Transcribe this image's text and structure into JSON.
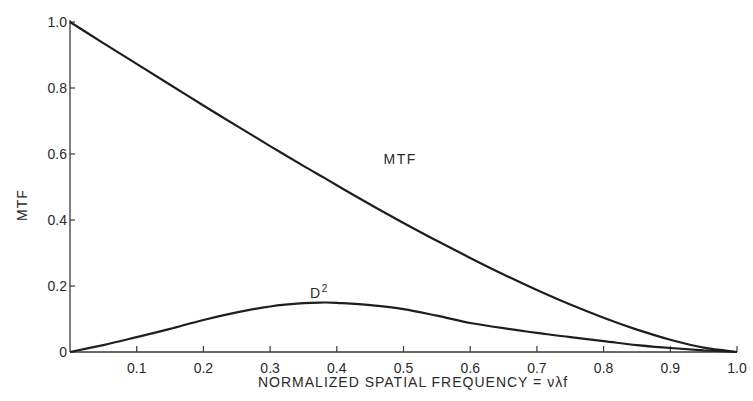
{
  "chart_data": {
    "type": "line",
    "title": "",
    "xlabel": "NORMALIZED SPATIAL FREQUENCY = νλf",
    "ylabel": "MTF",
    "xlim": [
      0,
      1.0
    ],
    "ylim": [
      0,
      1.0
    ],
    "grid": false,
    "legend": "none (curves labeled inline)",
    "x_ticks": [
      "0.1",
      "0.2",
      "0.3",
      "0.4",
      "0.5",
      "0.6",
      "0.7",
      "0.8",
      "0.9",
      "1.0"
    ],
    "y_ticks": [
      "0",
      "0.2",
      "0.4",
      "0.6",
      "0.8",
      "1.0"
    ],
    "x": [
      0.0,
      0.05,
      0.1,
      0.15,
      0.2,
      0.25,
      0.3,
      0.35,
      0.38,
      0.4,
      0.45,
      0.5,
      0.55,
      0.6,
      0.65,
      0.7,
      0.75,
      0.8,
      0.85,
      0.9,
      0.95,
      1.0
    ],
    "series": [
      {
        "name": "MTF",
        "label": "MTF",
        "values": [
          1.0,
          0.936,
          0.873,
          0.81,
          0.747,
          0.685,
          0.624,
          0.564,
          0.529,
          0.505,
          0.447,
          0.391,
          0.337,
          0.285,
          0.235,
          0.188,
          0.144,
          0.104,
          0.068,
          0.037,
          0.013,
          0.0
        ]
      },
      {
        "name": "D²",
        "label": "D",
        "label_sup": "2",
        "values": [
          0.0,
          0.021,
          0.045,
          0.07,
          0.097,
          0.12,
          0.138,
          0.148,
          0.15,
          0.149,
          0.142,
          0.13,
          0.11,
          0.088,
          0.072,
          0.058,
          0.045,
          0.033,
          0.021,
          0.012,
          0.005,
          0.0
        ]
      }
    ],
    "annotations": [
      {
        "text": "MTF",
        "x": 0.47,
        "y": 0.57
      },
      {
        "text": "D²",
        "x": 0.36,
        "y": 0.165
      }
    ]
  },
  "axes": {
    "origin_label": "0",
    "x_title": "NORMALIZED SPATIAL FREQUENCY = νλf",
    "y_title": "MTF"
  },
  "colors": {
    "line": "#1e1e1e",
    "axis": "#3a3a3a",
    "text": "#2a2a2a",
    "background": "#ffffff"
  }
}
